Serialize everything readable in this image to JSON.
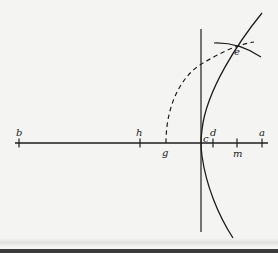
{
  "figure": {
    "colors": {
      "stroke": "#1e1e1e",
      "background": "#f4f4f2"
    },
    "axis": {
      "y": 143,
      "x_start": 15,
      "x_end": 268
    },
    "vertical_line": {
      "x": 201,
      "y_start": 29,
      "y_end": 232
    },
    "points": [
      {
        "id": "b",
        "label": "b",
        "x": 19,
        "tick": true,
        "label_pos": "above"
      },
      {
        "id": "h",
        "label": "h",
        "x": 140,
        "tick": true,
        "label_pos": "above"
      },
      {
        "id": "g",
        "label": "g",
        "x": 166,
        "tick": false,
        "label_pos": "below"
      },
      {
        "id": "c",
        "label": "c",
        "x": 201,
        "tick": false,
        "label_pos": "above-right"
      },
      {
        "id": "d",
        "label": "d",
        "x": 213,
        "tick": true,
        "label_pos": "above"
      },
      {
        "id": "m",
        "label": "m",
        "x": 237,
        "tick": true,
        "label_pos": "below"
      },
      {
        "id": "a",
        "label": "a",
        "x": 262,
        "tick": true,
        "label_pos": "above"
      }
    ],
    "intersection": {
      "id": "e",
      "label": "e",
      "x": 236,
      "y": 45
    }
  }
}
